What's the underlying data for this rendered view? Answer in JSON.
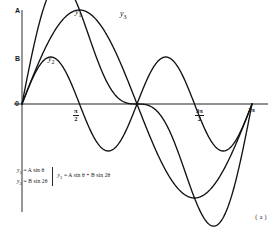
{
  "figure": {
    "caption": "( a )",
    "axis": {
      "y_top_label": "A",
      "y_mid_label": "B",
      "origin_label": "0"
    },
    "x_ticks": [
      {
        "name": "pi-over-2",
        "num": "π",
        "den": "2"
      },
      {
        "name": "three-pi-over-2",
        "num": "3π",
        "den": "2"
      }
    ],
    "x_tick_end": "2π",
    "curve_labels": {
      "y1": "y",
      "y1_sub": "1",
      "y2": "y",
      "y2_sub": "2",
      "y3": "y",
      "y3_sub": "3"
    },
    "equations": {
      "eq1_lhs": "y",
      "eq1_sub": "1",
      "eq1_rhs": "= A sin θ",
      "eq2_lhs": "y",
      "eq2_sub": "2",
      "eq2_rhs": "= B sin 2θ",
      "eq3_lhs": "y",
      "eq3_sub": "3",
      "eq3_rhs": "= A sin θ + B sin 2θ"
    },
    "colors": {
      "curve": "#121212",
      "axis": "#6b6b6b",
      "background": "#ffffff"
    }
  },
  "chart_data": {
    "type": "line",
    "title": "",
    "xlabel": "θ",
    "ylabel": "",
    "xlim": [
      0,
      6.283185307
    ],
    "ylim": [
      -1.5,
      1.5
    ],
    "grid": false,
    "legend": "inline-curve-labels",
    "x_tick_values": [
      0,
      1.570796327,
      4.71238898,
      6.283185307
    ],
    "x_tick_labels": [
      "0",
      "π/2",
      "3π/2",
      "2π"
    ],
    "y_tick_values": [
      0,
      0.5,
      1.0
    ],
    "y_tick_labels": [
      "0",
      "B",
      "A"
    ],
    "parameters": {
      "A": 1.0,
      "B": 0.5
    },
    "series": [
      {
        "name": "y1",
        "label": "y₁",
        "formula": "A sin θ",
        "amplitude": 1.0,
        "frequency": 1,
        "color": "#121212"
      },
      {
        "name": "y2",
        "label": "y₂",
        "formula": "B sin 2θ",
        "amplitude": 0.5,
        "frequency": 2,
        "color": "#121212"
      },
      {
        "name": "y3",
        "label": "y₃",
        "formula": "A sin θ + B sin 2θ",
        "amplitude": 1.0,
        "frequency": 1,
        "color": "#121212"
      }
    ]
  }
}
